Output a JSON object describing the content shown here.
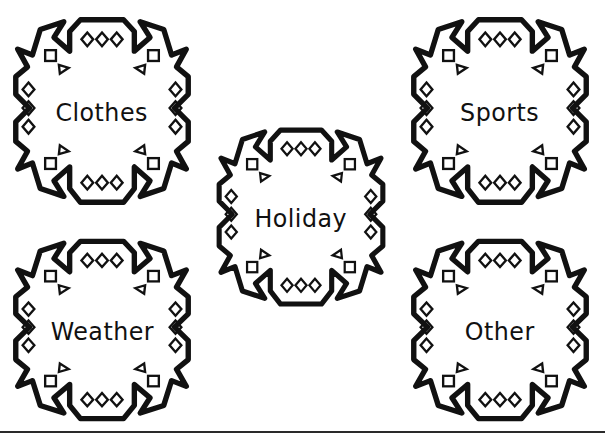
{
  "page": {
    "width": 605,
    "height": 439,
    "background_color": "#ffffff",
    "ink_color": "#111111",
    "clipped_heading_fragment": "apy"
  },
  "worksheet": {
    "title": "Snowflake Category Labels",
    "shape_name": "snowflake",
    "shape_decorations": [
      "diamond",
      "square",
      "triangle"
    ],
    "stroke_color": "#111111",
    "fill_color": "#ffffff"
  },
  "snowflakes": [
    {
      "id": "clothes",
      "label": "Clothes",
      "position": "top-left",
      "x": 4,
      "y": 6,
      "width": 196,
      "height": 212,
      "font_size": 25
    },
    {
      "id": "sports",
      "label": "Sports",
      "position": "top-right",
      "x": 402,
      "y": 6,
      "width": 196,
      "height": 212,
      "font_size": 25
    },
    {
      "id": "holiday",
      "label": "Holiday",
      "position": "center",
      "x": 208,
      "y": 117,
      "width": 186,
      "height": 202,
      "font_size": 25
    },
    {
      "id": "weather",
      "label": "Weather",
      "position": "bottom-left",
      "x": 4,
      "y": 228,
      "width": 196,
      "height": 206,
      "font_size": 25
    },
    {
      "id": "other",
      "label": "Other",
      "position": "bottom-right",
      "x": 402,
      "y": 228,
      "width": 196,
      "height": 206,
      "font_size": 25
    }
  ],
  "footer": {
    "rule_y": 431,
    "rule_color": "#2a2a2a"
  }
}
